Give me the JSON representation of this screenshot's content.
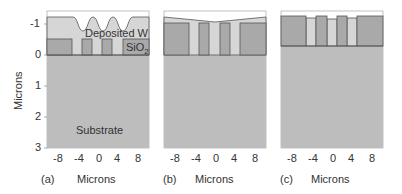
{
  "panels": [
    {
      "tag": "(a)",
      "xlabel": "Microns",
      "annotations": [
        "Deposited W",
        "SiO2",
        "Substrate"
      ]
    },
    {
      "tag": "(b)",
      "xlabel": "Microns"
    },
    {
      "tag": "(c)",
      "xlabel": "Microns"
    }
  ],
  "ylabel": "Microns",
  "yticks": [
    "-1",
    "0",
    "1",
    "2",
    "3"
  ],
  "xticks": [
    "-8",
    "-4",
    "0",
    "4",
    "8"
  ],
  "colors": {
    "substrate": "#bdbdbd",
    "oxide": "#a9a9a9",
    "tungsten": "#d6d6d6",
    "line": "#555555"
  }
}
